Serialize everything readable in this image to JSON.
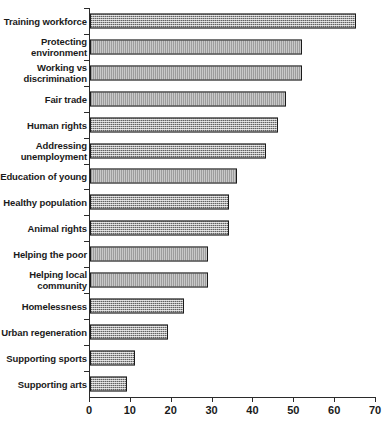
{
  "chart_data": {
    "type": "bar",
    "orientation": "horizontal",
    "title": "",
    "subtitle": "",
    "xlabel": "",
    "ylabel": "",
    "xlim": [
      0,
      70
    ],
    "xticks": [
      0,
      10,
      20,
      30,
      40,
      50,
      60,
      70
    ],
    "xtick_labels": [
      "0",
      "10",
      "20",
      "30",
      "40",
      "50",
      "60",
      "70"
    ],
    "grid": false,
    "legend": false,
    "legend_position": "none",
    "series_name": "",
    "bar_fill_color": "#a8a8a8",
    "bar_edge_color": "#1a1a1a",
    "axis_color": "#2b2b2b",
    "categories": [
      "Training workforce",
      "Protecting\nenvironment",
      "Working vs\ndiscrimination",
      "Fair trade",
      "Human rights",
      "Addressing\nunemployment",
      "Education of young",
      "Healthy population",
      "Animal rights",
      "Helping the poor",
      "Helping local\ncommunity",
      "Homelessness",
      "Urban regeneration",
      "Supporting sports",
      "Supporting arts"
    ],
    "values": [
      65,
      52,
      52,
      48,
      46,
      43,
      36,
      34,
      34,
      29,
      29,
      23,
      19,
      11,
      9
    ]
  }
}
